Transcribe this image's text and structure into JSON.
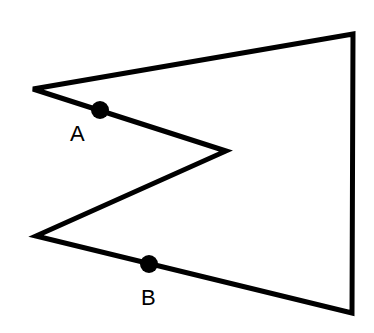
{
  "diagram": {
    "type": "concave-polygon",
    "stroke_color": "#000000",
    "background": "#ffffff",
    "points": [
      {
        "label": "A",
        "description": "point on upper-left edge"
      },
      {
        "label": "B",
        "description": "point on lower edge"
      }
    ]
  }
}
